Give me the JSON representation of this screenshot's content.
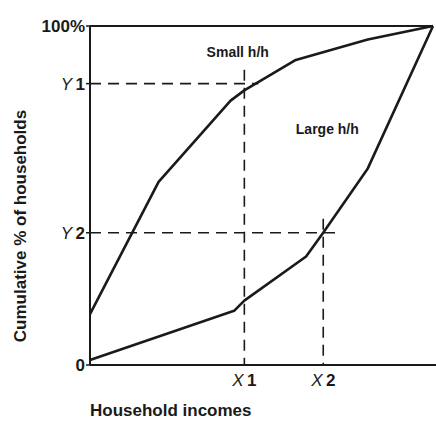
{
  "chart_data": {
    "type": "line",
    "title": "",
    "xlabel": "Household incomes",
    "ylabel": "Cumulative % of households",
    "y_ticks": [
      {
        "label": "100%",
        "italic_prefix": "",
        "value": 100
      },
      {
        "label": "1",
        "italic_prefix": "Y",
        "value": 83
      },
      {
        "label": "2",
        "italic_prefix": "Y",
        "value": 39
      },
      {
        "label": "0",
        "italic_prefix": "",
        "value": 0
      }
    ],
    "x_ticks": [
      {
        "label": "1",
        "italic_prefix": "X",
        "value": 45
      },
      {
        "label": "2",
        "italic_prefix": "X",
        "value": 68
      }
    ],
    "xlim": [
      0,
      100
    ],
    "ylim": [
      0,
      100
    ],
    "grid": false,
    "legend_position": "inline labels",
    "series": [
      {
        "name": "Small h/h",
        "label_pos": [
          34,
          91
        ],
        "points": [
          [
            0,
            15
          ],
          [
            20,
            54
          ],
          [
            41,
            78
          ],
          [
            45,
            81
          ],
          [
            60,
            90
          ],
          [
            81,
            96
          ],
          [
            100,
            100
          ]
        ]
      },
      {
        "name": "Large h/h",
        "label_pos": [
          60,
          68
        ],
        "points": [
          [
            0,
            1.5
          ],
          [
            42,
            16
          ],
          [
            45,
            19
          ],
          [
            63,
            32
          ],
          [
            68,
            39
          ],
          [
            81,
            58
          ],
          [
            100,
            100
          ]
        ]
      }
    ],
    "guides": [
      {
        "from": "Y1",
        "to": "X1",
        "at": [
          45,
          83
        ]
      },
      {
        "from": "Y2",
        "to": "X2",
        "at": [
          68,
          39
        ]
      }
    ]
  },
  "style": {
    "ink": "#1a1a1a",
    "background": "#ffffff"
  }
}
